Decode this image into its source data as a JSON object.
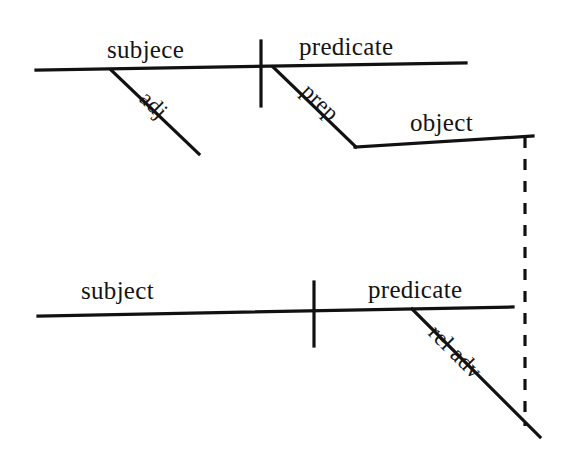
{
  "diagram": {
    "background_color": "#ffffff",
    "line_color": "#111111",
    "clauses": [
      {
        "name": "main-clause",
        "labels": {
          "subject": "subjece",
          "predicate": "predicate",
          "adjective": "adj",
          "preposition": "prep",
          "object": "object"
        }
      },
      {
        "name": "subordinate-clause",
        "labels": {
          "subject": "subject",
          "predicate": "predicate",
          "relative_adverb": "rel adv"
        }
      }
    ],
    "connector": {
      "style": "dashed",
      "name": "relative-adverb-connector"
    }
  }
}
